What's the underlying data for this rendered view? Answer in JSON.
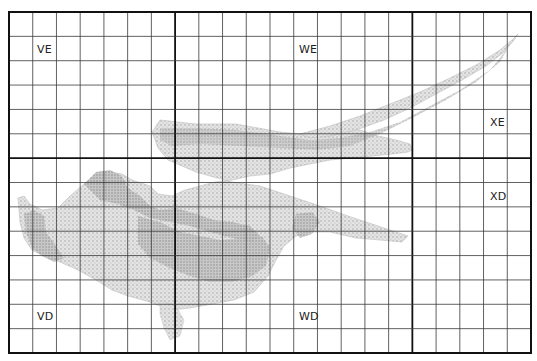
{
  "map": {
    "grid": {
      "left": 9,
      "top": 12,
      "right": 531,
      "bottom": 353,
      "columns": 22,
      "rows": 14,
      "major_columns": [
        7,
        17
      ],
      "major_rows": [
        6
      ],
      "line_color": "#3a3a3a",
      "major_line_color": "#111111"
    },
    "sheets": [
      {
        "id": "VE",
        "label": "VE",
        "x": 37,
        "y": 43
      },
      {
        "id": "WE",
        "label": "WE",
        "x": 299,
        "y": 43
      },
      {
        "id": "XE",
        "label": "XE",
        "x": 490,
        "y": 116
      },
      {
        "id": "XD",
        "label": "XD",
        "x": 490,
        "y": 190
      },
      {
        "id": "VD",
        "label": "VD",
        "x": 37,
        "y": 310
      },
      {
        "id": "WD",
        "label": "WD",
        "x": 299,
        "y": 310
      }
    ],
    "colors": {
      "land_light": "#d9d9d9",
      "land_mid": "#b8b8b8",
      "land_dark": "#8f8f8f",
      "background": "#ffffff"
    }
  }
}
